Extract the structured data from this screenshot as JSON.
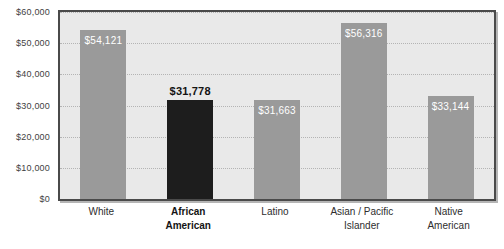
{
  "chart_data": {
    "type": "bar",
    "title": "",
    "subtitle": "",
    "xlabel": "",
    "ylabel": "",
    "ylim": [
      0,
      60000
    ],
    "grid": true,
    "legend": "none",
    "categories": [
      "White",
      "African\nAmerican",
      "Latino",
      "Asian / Pacific\nIslander",
      "Native\nAmerican"
    ],
    "values": [
      54121,
      31663,
      31663,
      56316,
      33144
    ],
    "bars": [
      {
        "category": "White",
        "value": 54121,
        "label": "$54,121",
        "color": "#9a9a9a",
        "label_position": "inside",
        "highlight": false
      },
      {
        "category": "African\nAmerican",
        "value": 31778,
        "label": "$31,778",
        "color": "#1d1d1d",
        "label_position": "above",
        "highlight": true
      },
      {
        "category": "Latino",
        "value": 31663,
        "label": "$31,663",
        "color": "#9a9a9a",
        "label_position": "inside",
        "highlight": false
      },
      {
        "category": "Asian / Pacific\nIslander",
        "value": 56316,
        "label": "$56,316",
        "color": "#9a9a9a",
        "label_position": "inside",
        "highlight": false
      },
      {
        "category": "Native\nAmerican",
        "value": 33144,
        "label": "$33,144",
        "color": "#9a9a9a",
        "label_position": "inside",
        "highlight": false
      }
    ],
    "y_ticks": [
      {
        "value": 60000,
        "label": "$60,000"
      },
      {
        "value": 50000,
        "label": "$50,000"
      },
      {
        "value": 40000,
        "label": "$40,000"
      },
      {
        "value": 30000,
        "label": "$30,000"
      },
      {
        "value": 20000,
        "label": "$20,000"
      },
      {
        "value": 10000,
        "label": "$10,000"
      },
      {
        "value": 0,
        "label": "$0"
      }
    ],
    "colors": {
      "bar_default": "#9a9a9a",
      "bar_highlight": "#1d1d1d",
      "plot_background": "#e9e9e9",
      "frame": "#4a4a4a",
      "gridline": "#b4b4b4",
      "text": "#2e2e2e"
    }
  }
}
